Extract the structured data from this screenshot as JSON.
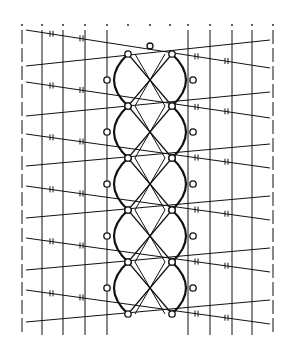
{
  "diagram": {
    "type": "bobbin lace pricking diagram",
    "stroke_color": "#111111",
    "background": "#ffffff",
    "frame": {
      "left": 22,
      "right": 273,
      "top": 25,
      "bottom": 335
    },
    "vertical_threads_left": [
      22,
      42,
      63,
      85,
      107
    ],
    "vertical_threads_right": [
      188,
      210,
      232,
      252,
      273
    ],
    "diagonal_rows": [
      30,
      62,
      82,
      112,
      134,
      162,
      186,
      214,
      238,
      266,
      290,
      318
    ],
    "center_pin": {
      "x": 150,
      "y": 46
    },
    "lozenges": [
      {
        "cy": 80
      },
      {
        "cy": 132
      },
      {
        "cy": 184
      },
      {
        "cy": 236
      },
      {
        "cy": 288
      }
    ]
  }
}
